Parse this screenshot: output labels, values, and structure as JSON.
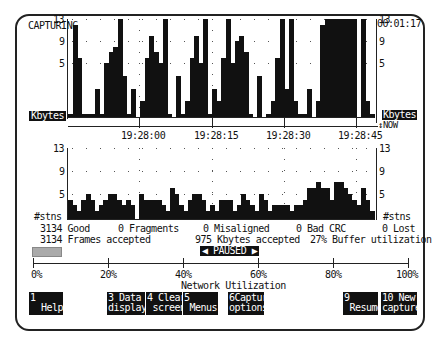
{
  "status": {
    "mode": "CAPTURING",
    "elapsed": "00:01:17"
  },
  "top_chart": {
    "unit_label": "Kbytes",
    "unit_label_right": "Kbytes",
    "now_label": "NOW",
    "y_ticks": [
      "13",
      "9",
      "5"
    ],
    "time_labels": [
      "19:28:00",
      "19:28:15",
      "19:28:30",
      "19:28:45"
    ]
  },
  "bottom_chart": {
    "unit_label": "#stns",
    "unit_label_right": "#stns",
    "y_ticks": [
      "13",
      "9",
      "5"
    ]
  },
  "stats": {
    "row1": {
      "good": "3134 Good",
      "fragments": "0 Fragments",
      "misaligned": "0 Misaligned",
      "bad_crc": "0 Bad CRC",
      "lost": "0 Lost"
    },
    "row2": {
      "frames": "3134 Frames accepted",
      "kbytes": "975 Kbytes accepted",
      "buffer": "27% Buffer utilization"
    }
  },
  "paused_label": "◀ PAUSED ▶",
  "utilization": {
    "title": "Network Utilization",
    "ticks": [
      "0%",
      "20%",
      "40%",
      "60%",
      "80%",
      "100%"
    ],
    "value_percent": 8
  },
  "function_keys": [
    {
      "num": "1",
      "line1": "1",
      "line2": "  Help"
    },
    {
      "num": "3",
      "line1": "3 Data",
      "line2": "display"
    },
    {
      "num": "4",
      "line1": "4 Clear",
      "line2": " screen"
    },
    {
      "num": "5",
      "line1": "5",
      "line2": " Menus"
    },
    {
      "num": "6",
      "line1": "6Captur",
      "line2": "options"
    },
    {
      "num": "9",
      "line1": "9",
      "line2": " Resume"
    },
    {
      "num": "10",
      "line1": "10 New",
      "line2": "capture"
    }
  ],
  "chart_data": [
    {
      "type": "bar",
      "title": "Kbytes per interval",
      "ylabel": "Kbytes",
      "ylim": [
        0,
        13
      ],
      "x_tick_labels": [
        "19:28:00",
        "19:28:15",
        "19:28:30",
        "19:28:45"
      ],
      "values": [
        1,
        12,
        6,
        1,
        1,
        1,
        3,
        1,
        5,
        7,
        8,
        13,
        4,
        1,
        3,
        0,
        2,
        6,
        10,
        7,
        5,
        13,
        1,
        0,
        4,
        1,
        2,
        6,
        10,
        5,
        13,
        1,
        3,
        2,
        6,
        13,
        5,
        9,
        10,
        7,
        1,
        0,
        4,
        0,
        1,
        2,
        6,
        13,
        3,
        13,
        2,
        1,
        1,
        3,
        0,
        2,
        12,
        13,
        13,
        13,
        13,
        13,
        13,
        13,
        0,
        13,
        2,
        1
      ]
    },
    {
      "type": "bar",
      "title": "Stations per interval",
      "ylabel": "#stns",
      "ylim": [
        0,
        13
      ],
      "values": [
        4,
        3,
        2,
        4,
        5,
        4,
        2,
        3,
        4,
        5,
        5,
        4,
        3,
        4,
        3,
        0,
        5,
        4,
        4,
        4,
        4,
        3,
        2,
        6,
        5,
        3,
        2,
        4,
        5,
        5,
        4,
        2,
        3,
        2,
        4,
        4,
        4,
        2,
        3,
        5,
        4,
        3,
        2,
        5,
        4,
        2,
        3,
        3,
        3,
        3,
        2,
        3,
        3,
        4,
        6,
        6,
        7,
        6,
        6,
        4,
        7,
        7,
        6,
        5,
        4,
        3,
        6,
        4,
        2
      ]
    }
  ]
}
